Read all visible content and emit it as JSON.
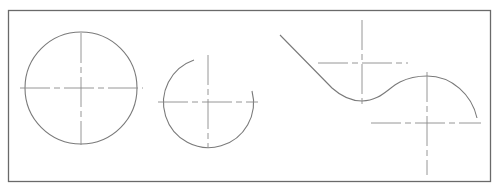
{
  "drawing": {
    "frame": {
      "x": 8,
      "y": 10,
      "width": 483,
      "height": 172,
      "color": "#6a6a6a"
    },
    "line_color": "#7a7a7a",
    "centerline_color": "#8a8a8a",
    "shapes": [
      {
        "type": "circle",
        "cx": 81,
        "cy": 88,
        "r": 56
      },
      {
        "type": "arc",
        "cx": 208,
        "cy": 102,
        "r": 45,
        "from": [
          193,
          60
        ],
        "to": [
          252,
          90
        ]
      },
      {
        "type": "polyline-curve",
        "points": [
          [
            280,
            35
          ],
          [
            330,
            86
          ],
          [
            362,
            101
          ],
          [
            427,
            76
          ],
          [
            477,
            118
          ]
        ]
      }
    ],
    "centerlines": [
      {
        "cx": 81,
        "cy": 88,
        "h": [
          20,
          143
        ],
        "v": [
          33,
          145
        ]
      },
      {
        "cx": 208,
        "cy": 102,
        "h": [
          158,
          258
        ],
        "v": [
          55,
          148
        ]
      },
      {
        "cx": 362,
        "cy": 63,
        "h": [
          318,
          408
        ],
        "v": [
          20,
          105
        ]
      },
      {
        "cx": 427,
        "cy": 123,
        "h": [
          371,
          481
        ],
        "v": [
          72,
          175
        ]
      }
    ]
  }
}
